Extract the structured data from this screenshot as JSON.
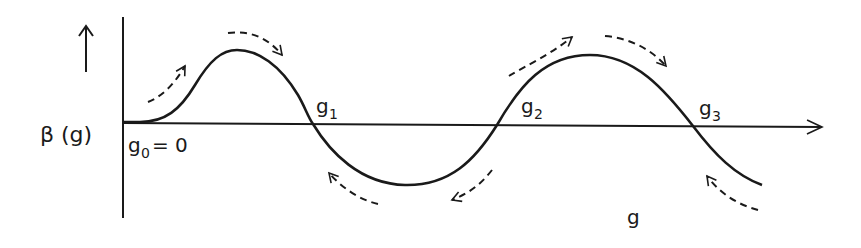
{
  "diagram": {
    "type": "beta-function-flow",
    "y_label": "β (g)",
    "x_label": "g",
    "fixed_points": [
      {
        "name": "g0",
        "label": "g",
        "sub": "0",
        "suffix": "= 0",
        "x": 123
      },
      {
        "name": "g1",
        "label": "g",
        "sub": "1",
        "x": 313
      },
      {
        "name": "g2",
        "label": "g",
        "sub": "2",
        "x": 497
      },
      {
        "name": "g3",
        "label": "g",
        "sub": "3",
        "x": 693
      }
    ],
    "flow_arrows": [
      {
        "region": "g0-g1 rising",
        "direction": "right"
      },
      {
        "region": "g0-g1 peak",
        "direction": "right"
      },
      {
        "region": "g1-g2 trough left",
        "direction": "left"
      },
      {
        "region": "g1-g2 trough right",
        "direction": "left"
      },
      {
        "region": "g2-g3 rising",
        "direction": "right"
      },
      {
        "region": "g2-g3 peak",
        "direction": "right"
      },
      {
        "region": "beyond g3",
        "direction": "left"
      }
    ],
    "colors": {
      "line": "#1a1a1a",
      "background": "#ffffff"
    }
  }
}
